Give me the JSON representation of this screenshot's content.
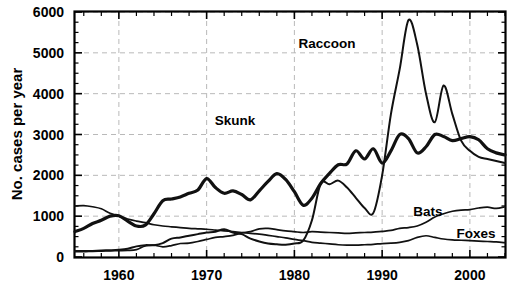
{
  "chart_data": {
    "type": "line",
    "title": "",
    "xlabel": "",
    "ylabel": "No. cases per year",
    "xlim": [
      1955,
      2004
    ],
    "ylim": [
      0,
      6000
    ],
    "grid": true,
    "legend_position": "inline-annotations",
    "x_ticks": [
      1960,
      1970,
      1980,
      1990,
      2000
    ],
    "x_tick_labels": [
      "1960",
      "1970",
      "1980",
      "1990",
      "2000"
    ],
    "x_minor_tick_step": 2,
    "y_ticks": [
      0,
      1000,
      2000,
      3000,
      4000,
      5000,
      6000
    ],
    "y_tick_labels": [
      "0",
      "1000",
      "2000",
      "3000",
      "4000",
      "5000",
      "6000"
    ],
    "series": [
      {
        "name": "Skunk",
        "label": "Skunk",
        "stroke": "#111111",
        "width": "thick",
        "x": [
          1955,
          1956,
          1957,
          1958,
          1959,
          1960,
          1961,
          1962,
          1963,
          1964,
          1965,
          1966,
          1967,
          1968,
          1969,
          1970,
          1971,
          1972,
          1973,
          1974,
          1975,
          1976,
          1977,
          1978,
          1979,
          1980,
          1981,
          1982,
          1983,
          1984,
          1985,
          1986,
          1987,
          1988,
          1989,
          1990,
          1991,
          1992,
          1993,
          1994,
          1995,
          1996,
          1997,
          1998,
          1999,
          2000,
          2001,
          2002,
          2003,
          2004
        ],
        "values": [
          620,
          700,
          820,
          900,
          1000,
          1010,
          880,
          760,
          780,
          1060,
          1380,
          1420,
          1470,
          1560,
          1640,
          1920,
          1700,
          1560,
          1620,
          1530,
          1400,
          1620,
          1850,
          2040,
          1900,
          1600,
          1270,
          1440,
          1800,
          2050,
          2260,
          2280,
          2600,
          2400,
          2650,
          2300,
          2600,
          3000,
          2900,
          2550,
          2700,
          3000,
          2950,
          2850,
          2900,
          2950,
          2870,
          2650,
          2550,
          2500
        ]
      },
      {
        "name": "Raccoon",
        "label": "Raccoon",
        "stroke": "#111111",
        "width": "med",
        "x": [
          1955,
          1956,
          1957,
          1958,
          1959,
          1960,
          1961,
          1962,
          1963,
          1964,
          1965,
          1966,
          1967,
          1968,
          1969,
          1970,
          1971,
          1972,
          1973,
          1974,
          1975,
          1976,
          1977,
          1978,
          1979,
          1980,
          1981,
          1982,
          1983,
          1984,
          1985,
          1986,
          1987,
          1988,
          1989,
          1990,
          1991,
          1992,
          1993,
          1994,
          1995,
          1996,
          1997,
          1998,
          1999,
          2000,
          2001,
          2002,
          2003,
          2004
        ],
        "values": [
          150,
          145,
          150,
          160,
          165,
          175,
          200,
          260,
          290,
          290,
          340,
          450,
          480,
          520,
          560,
          600,
          620,
          680,
          600,
          560,
          450,
          380,
          330,
          310,
          300,
          330,
          400,
          900,
          1800,
          1780,
          1870,
          1700,
          1450,
          1200,
          1080,
          2000,
          3500,
          4600,
          5800,
          5200,
          4000,
          3300,
          4200,
          3500,
          2850,
          2600,
          2450,
          2400,
          2350,
          2300
        ]
      },
      {
        "name": "Bats",
        "label": "Bats",
        "stroke": "#111111",
        "width": "thin",
        "x": [
          1955,
          1956,
          1957,
          1958,
          1959,
          1960,
          1961,
          1962,
          1963,
          1964,
          1965,
          1966,
          1967,
          1968,
          1969,
          1970,
          1971,
          1972,
          1973,
          1974,
          1975,
          1976,
          1977,
          1978,
          1979,
          1980,
          1981,
          1982,
          1983,
          1984,
          1985,
          1986,
          1987,
          1988,
          1989,
          1990,
          1991,
          1992,
          1993,
          1994,
          1995,
          1996,
          1997,
          1998,
          1999,
          2000,
          2001,
          2002,
          2003,
          2004
        ],
        "values": [
          130,
          130,
          140,
          145,
          150,
          155,
          160,
          180,
          270,
          290,
          250,
          280,
          330,
          340,
          380,
          430,
          480,
          500,
          530,
          590,
          620,
          690,
          700,
          670,
          640,
          620,
          600,
          620,
          610,
          600,
          590,
          580,
          590,
          600,
          610,
          630,
          650,
          700,
          720,
          760,
          850,
          980,
          1060,
          1120,
          1150,
          1160,
          1200,
          1220,
          1190,
          1230
        ]
      },
      {
        "name": "Foxes",
        "label": "Foxes",
        "stroke": "#111111",
        "width": "thin",
        "x": [
          1955,
          1956,
          1957,
          1958,
          1959,
          1960,
          1961,
          1962,
          1963,
          1964,
          1965,
          1966,
          1967,
          1968,
          1969,
          1970,
          1971,
          1972,
          1973,
          1974,
          1975,
          1976,
          1977,
          1978,
          1979,
          1980,
          1981,
          1982,
          1983,
          1984,
          1985,
          1986,
          1987,
          1988,
          1989,
          1990,
          1991,
          1992,
          1993,
          1994,
          1995,
          1996,
          1997,
          1998,
          1999,
          2000,
          2001,
          2002,
          2003,
          2004
        ],
        "values": [
          1250,
          1260,
          1230,
          1180,
          1070,
          1000,
          930,
          880,
          840,
          790,
          760,
          740,
          720,
          700,
          690,
          680,
          660,
          640,
          620,
          600,
          580,
          560,
          530,
          500,
          470,
          430,
          400,
          360,
          340,
          320,
          300,
          290,
          290,
          300,
          310,
          330,
          340,
          360,
          400,
          480,
          520,
          480,
          440,
          420,
          410,
          400,
          390,
          380,
          370,
          350
        ]
      }
    ],
    "annotations": [
      {
        "name": "skunk-label",
        "text": "Skunk",
        "x_px": 235,
        "y_px": 125
      },
      {
        "name": "raccoon-label",
        "text": "Raccoon",
        "x_px": 327,
        "y_px": 48
      },
      {
        "name": "bats-label",
        "text": "Bats",
        "x_px": 428,
        "y_px": 216
      },
      {
        "name": "foxes-label",
        "text": "Foxes",
        "x_px": 476,
        "y_px": 238
      }
    ]
  },
  "axes": {
    "y_axis_title": "No. cases per year"
  }
}
